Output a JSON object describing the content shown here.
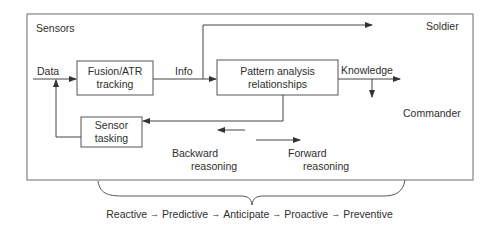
{
  "diagram": {
    "frame_labels": {
      "sensors": "Sensors",
      "soldier": "Soldier",
      "commander": "Commander"
    },
    "edge_labels": {
      "data": "Data",
      "info": "Info",
      "knowledge": "Knowledge"
    },
    "boxes": {
      "fusion": {
        "line1": "Fusion/ATR",
        "line2": "tracking"
      },
      "pattern": {
        "line1": "Pattern analysis",
        "line2": "relationships"
      },
      "sensor_tasking": {
        "line1": "Sensor",
        "line2": "tasking"
      }
    },
    "reasoning": {
      "backward": {
        "line1": "Backward",
        "line2": "reasoning",
        "arrow": "left"
      },
      "forward": {
        "line1": "Forward",
        "line2": "reasoning",
        "arrow": "right"
      }
    },
    "progression": {
      "arrow_glyph": "→",
      "stages": [
        "Reactive",
        "Predictive",
        "Anticipate",
        "Proactive",
        "Preventive"
      ]
    },
    "colors": {
      "line": "#555555",
      "text": "#2e2e2e",
      "background": "#ffffff"
    }
  }
}
